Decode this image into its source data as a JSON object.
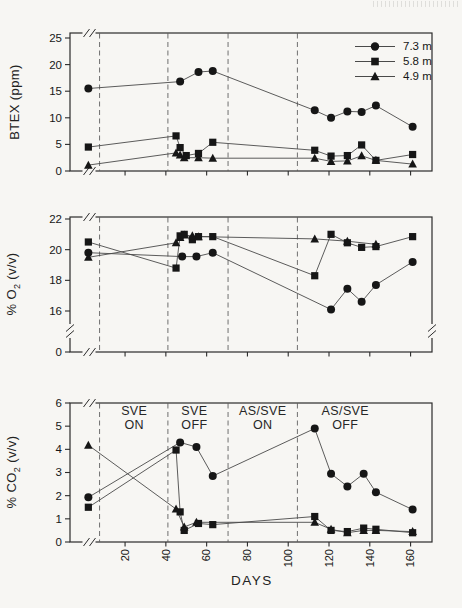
{
  "colors": {
    "paper": "#f7f6f3",
    "ink": "#161616",
    "data_line": "#4a4a4a",
    "frame": "#2b2b2b",
    "dashed_line": "#6f6f6f"
  },
  "x_axis": {
    "label": "DAYS",
    "ticks": [
      20,
      40,
      60,
      80,
      100,
      120,
      140,
      160
    ],
    "range": [
      -7,
      170.5
    ],
    "phase_line_days": [
      7.5,
      41,
      70.5,
      104.5
    ],
    "axis_break_at_left": true
  },
  "legend": {
    "items": [
      {
        "marker": "circle",
        "label": "7.3 m"
      },
      {
        "marker": "square",
        "label": "5.8 m"
      },
      {
        "marker": "triangle",
        "label": "4.9 m"
      }
    ]
  },
  "phases": [
    {
      "line1": "SVE",
      "line2": "ON",
      "center_day": 24.5
    },
    {
      "line1": "SVE",
      "line2": "OFF",
      "center_day": 54
    },
    {
      "line1": "AS/SVE",
      "line2": "ON",
      "center_day": 87.5
    },
    {
      "line1": "AS/SVE",
      "line2": "OFF",
      "center_day": 128
    }
  ],
  "chart_data": [
    {
      "type": "line",
      "id": "btex",
      "ylabel": {
        "prefix": "BTEX (ppm)",
        "sub": "",
        "suffix": ""
      },
      "ylim": [
        0,
        25
      ],
      "yticks": [
        25,
        20,
        15,
        10,
        5,
        0
      ],
      "grid": false,
      "series": [
        {
          "name": "7.3 m",
          "marker": "circle",
          "points": [
            [
              2,
              15.5
            ],
            [
              47,
              16.8
            ],
            [
              56,
              18.6
            ],
            [
              63,
              18.8
            ],
            [
              113,
              11.4
            ],
            [
              121,
              10.0
            ],
            [
              129,
              11.2
            ],
            [
              136,
              11.1
            ],
            [
              143,
              12.3
            ],
            [
              161,
              8.3
            ]
          ]
        },
        {
          "name": "5.8 m",
          "marker": "square",
          "points": [
            [
              2,
              4.5
            ],
            [
              45,
              6.6
            ],
            [
              47,
              4.4
            ],
            [
              50,
              2.9
            ],
            [
              56,
              3.3
            ],
            [
              63,
              5.4
            ],
            [
              113,
              3.9
            ],
            [
              121,
              2.8
            ],
            [
              129,
              2.9
            ],
            [
              136,
              4.9
            ],
            [
              143,
              2.0
            ],
            [
              161,
              3.1
            ]
          ]
        },
        {
          "name": "4.9 m",
          "marker": "triangle",
          "points": [
            [
              2,
              1.1
            ],
            [
              45,
              3.4
            ],
            [
              47,
              3.0
            ],
            [
              49,
              2.5
            ],
            [
              56,
              2.5
            ],
            [
              63,
              2.4
            ],
            [
              113,
              2.4
            ],
            [
              121,
              1.8
            ],
            [
              129,
              1.9
            ],
            [
              136,
              2.85
            ],
            [
              143,
              2.0
            ],
            [
              161,
              1.3
            ]
          ]
        }
      ]
    },
    {
      "type": "line",
      "id": "o2",
      "ylabel": {
        "prefix": "% O",
        "sub": "2",
        "suffix": " (v/v)"
      },
      "ylim": [
        16,
        22
      ],
      "y_break_to_zero": true,
      "yticks": [
        22,
        20,
        18,
        16,
        0
      ],
      "grid": false,
      "series": [
        {
          "name": "7.3 m",
          "marker": "circle",
          "points": [
            [
              2,
              19.8
            ],
            [
              48,
              19.55
            ],
            [
              55,
              19.55
            ],
            [
              63,
              19.8
            ],
            [
              121,
              16.1
            ],
            [
              129,
              17.45
            ],
            [
              136,
              16.6
            ],
            [
              143,
              17.7
            ],
            [
              161,
              19.2
            ]
          ]
        },
        {
          "name": "5.8 m",
          "marker": "square",
          "points": [
            [
              2,
              20.5
            ],
            [
              45,
              18.8
            ],
            [
              47,
              20.9
            ],
            [
              49,
              21.0
            ],
            [
              53,
              20.65
            ],
            [
              56,
              20.85
            ],
            [
              63,
              20.85
            ],
            [
              113,
              18.3
            ],
            [
              121,
              21.0
            ],
            [
              129,
              20.45
            ],
            [
              136,
              20.15
            ],
            [
              143,
              20.2
            ],
            [
              161,
              20.85
            ]
          ]
        },
        {
          "name": "4.9 m",
          "marker": "triangle",
          "points": [
            [
              2,
              19.5
            ],
            [
              45,
              20.45
            ],
            [
              47,
              20.8
            ],
            [
              49,
              20.95
            ],
            [
              53,
              20.9
            ],
            [
              56,
              20.85
            ],
            [
              113,
              20.7
            ],
            [
              129,
              20.55
            ],
            [
              143,
              20.35
            ]
          ]
        }
      ]
    },
    {
      "type": "line",
      "id": "co2",
      "ylabel": {
        "prefix": "% CO",
        "sub": "2",
        "suffix": " (v/v)"
      },
      "ylim": [
        0,
        6
      ],
      "yticks": [
        6,
        5,
        4,
        3,
        2,
        1,
        0
      ],
      "grid": false,
      "series": [
        {
          "name": "7.3 m",
          "marker": "circle",
          "points": [
            [
              2,
              1.93
            ],
            [
              47,
              4.3
            ],
            [
              55,
              4.1
            ],
            [
              63,
              2.85
            ],
            [
              113,
              4.9
            ],
            [
              121,
              2.95
            ],
            [
              129,
              2.4
            ],
            [
              137,
              2.95
            ],
            [
              143,
              2.15
            ],
            [
              161,
              1.4
            ]
          ]
        },
        {
          "name": "5.8 m",
          "marker": "square",
          "points": [
            [
              2,
              1.5
            ],
            [
              45,
              3.97
            ],
            [
              47,
              1.3
            ],
            [
              49,
              0.5
            ],
            [
              56,
              0.8
            ],
            [
              63,
              0.75
            ],
            [
              113,
              1.1
            ],
            [
              121,
              0.5
            ],
            [
              129,
              0.45
            ],
            [
              137,
              0.6
            ],
            [
              143,
              0.55
            ],
            [
              161,
              0.4
            ]
          ]
        },
        {
          "name": "4.9 m",
          "marker": "triangle",
          "points": [
            [
              2,
              4.18
            ],
            [
              45,
              1.42
            ],
            [
              49,
              0.65
            ],
            [
              55,
              0.85
            ],
            [
              113,
              0.85
            ],
            [
              121,
              0.55
            ],
            [
              129,
              0.4
            ],
            [
              137,
              0.5
            ],
            [
              143,
              0.5
            ],
            [
              161,
              0.45
            ]
          ]
        }
      ]
    }
  ]
}
